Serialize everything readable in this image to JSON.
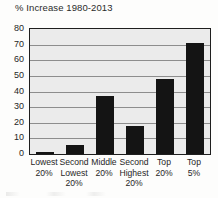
{
  "chart_data": {
    "type": "bar",
    "title": "% Increase 1980-2013",
    "xlabel": "",
    "ylabel": "",
    "ylim": [
      0,
      80
    ],
    "yticks": [
      0,
      10,
      20,
      30,
      40,
      50,
      60,
      70,
      80
    ],
    "grid": true,
    "legend": false,
    "categories": [
      "Lowest 20%",
      "Second Lowest 20%",
      "Middle 20%",
      "Second Highest 20%",
      "Top 20%",
      "Top 5%"
    ],
    "category_lines": [
      [
        "Lowest",
        "20%"
      ],
      [
        "Second",
        "Lowest",
        "20%"
      ],
      [
        "Middle",
        "20%"
      ],
      [
        "Second",
        "Highest",
        "20%"
      ],
      [
        "Top",
        "20%"
      ],
      [
        "Top",
        "5%"
      ]
    ],
    "values": [
      1,
      6,
      37,
      18,
      48,
      71
    ],
    "bar_color": "#141414",
    "plot_background": "#ebebeb",
    "gridline_color": "#8d8d8d",
    "axis_color": "#1e1e1e"
  }
}
